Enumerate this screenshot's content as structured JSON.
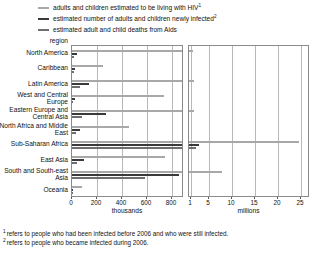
{
  "legend": {
    "items": [
      {
        "label": "adults and children estimated to be living with HIV",
        "marker": "1",
        "color": "#a8a8a8",
        "icon": "legend-line-icon"
      },
      {
        "label": "estimated number of adults and children newly infected",
        "marker": "2",
        "color": "#3a3a3a",
        "icon": "legend-line-icon"
      },
      {
        "label": "estimated adult and child deaths from Aids",
        "marker": "",
        "color": "#6e6e6e",
        "icon": "legend-line-icon"
      }
    ]
  },
  "axis_title": "region",
  "footnotes": [
    {
      "marker": "1",
      "text": "refers to people who had been infected before 2006 and who were still infected."
    },
    {
      "marker": "2",
      "text": "refers to people who became infected during 2006."
    }
  ],
  "chart_data": {
    "type": "bar",
    "orientation": "horizontal",
    "title": "",
    "xlabel": "",
    "ylabel": "region",
    "grid": true,
    "legend_position": "top",
    "panels": [
      {
        "name": "left",
        "unit": "thousands",
        "xlim": [
          0,
          900
        ],
        "ticks": [
          0,
          200,
          400,
          600,
          800
        ],
        "ticklabels": [
          "0",
          "200",
          "400",
          "600",
          "800"
        ]
      },
      {
        "name": "right",
        "unit": "millions",
        "xlim": [
          0.6,
          27
        ],
        "ticks": [
          1,
          5,
          10,
          15,
          20,
          25
        ],
        "ticklabels": [
          "1",
          "5",
          "10",
          "15",
          "20",
          "25"
        ]
      }
    ],
    "categories": [
      "North America",
      "Caribbean",
      "Latin America",
      "West and Central Europe",
      "Eastern Europe and Central Asia",
      "North Africa and Middle East",
      "Sub-Saharan Africa",
      "East Asia",
      "South and South-east Asia",
      "Oceania"
    ],
    "series": [
      {
        "name": "adults and children estimated to be living with HIV",
        "color": "#a8a8a8",
        "unit": "thousands",
        "values": [
          1400,
          250,
          1700,
          740,
          1700,
          460,
          24700,
          750,
          7800,
          81
        ]
      },
      {
        "name": "estimated number of adults and children newly infected",
        "color": "#3a3a3a",
        "unit": "thousands",
        "values": [
          43,
          27,
          140,
          22,
          270,
          68,
          2800,
          100,
          860,
          7.1
        ]
      },
      {
        "name": "estimated adult and child deaths from Aids",
        "color": "#6e6e6e",
        "unit": "thousands",
        "values": [
          18,
          19,
          65,
          12,
          84,
          36,
          2100,
          43,
          590,
          4
        ]
      }
    ]
  }
}
